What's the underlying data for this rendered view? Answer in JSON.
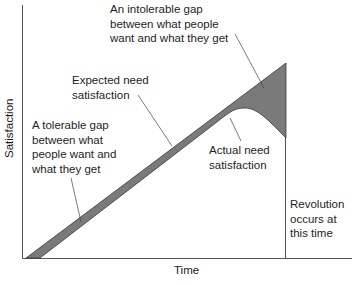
{
  "diagram": {
    "axes": {
      "x_label": "Time",
      "y_label": "Satisfaction"
    },
    "annotations": {
      "intolerable_gap": "An intolerable gap\nbetween what people\nwant and what they get",
      "expected_need": "Expected need\nsatisfaction",
      "tolerable_gap": "A tolerable gap\nbetween what\npeople want and\nwhat they get",
      "actual_need": "Actual need\nsatisfaction",
      "revolution": "Revolution\noccurs at\nthis time"
    },
    "colors": {
      "gap_fill": "#7a7a7a",
      "axis": "#555555",
      "leader": "#444444",
      "text": "#1e1e1e"
    }
  }
}
